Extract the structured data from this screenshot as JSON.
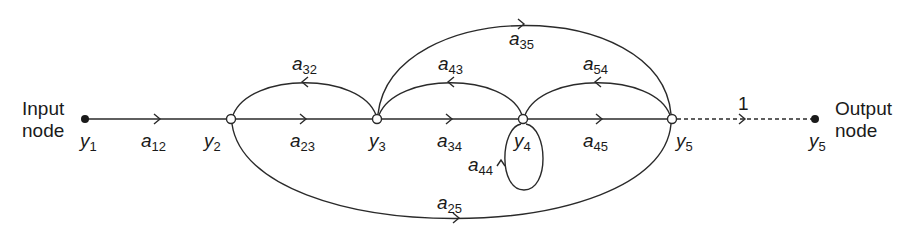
{
  "diagram": {
    "type": "signal-flow-graph",
    "input_label": [
      "Input",
      "node"
    ],
    "output_label": [
      "Output",
      "node"
    ],
    "nodes": [
      {
        "id": "y1",
        "name": "y",
        "sub": "1",
        "x": 85,
        "y": 119,
        "kind": "source"
      },
      {
        "id": "y2",
        "name": "y",
        "sub": "2",
        "x": 231,
        "y": 119,
        "kind": "mixed"
      },
      {
        "id": "y3",
        "name": "y",
        "sub": "3",
        "x": 377,
        "y": 119,
        "kind": "mixed"
      },
      {
        "id": "y4",
        "name": "y",
        "sub": "4",
        "x": 523,
        "y": 119,
        "kind": "mixed"
      },
      {
        "id": "y5",
        "name": "y",
        "sub": "5",
        "x": 672,
        "y": 119,
        "kind": "mixed"
      },
      {
        "id": "y5out",
        "name": "y",
        "sub": "5",
        "x": 815,
        "y": 119,
        "kind": "sink"
      }
    ],
    "branches": [
      {
        "id": "a12",
        "name": "a",
        "sub": "12",
        "from": "y1",
        "to": "y2"
      },
      {
        "id": "a23",
        "name": "a",
        "sub": "23",
        "from": "y2",
        "to": "y3"
      },
      {
        "id": "a34",
        "name": "a",
        "sub": "34",
        "from": "y3",
        "to": "y4"
      },
      {
        "id": "a45",
        "name": "a",
        "sub": "45",
        "from": "y4",
        "to": "y5"
      },
      {
        "id": "a32",
        "name": "a",
        "sub": "32",
        "from": "y3",
        "to": "y2"
      },
      {
        "id": "a43",
        "name": "a",
        "sub": "43",
        "from": "y4",
        "to": "y3"
      },
      {
        "id": "a54",
        "name": "a",
        "sub": "54",
        "from": "y5",
        "to": "y4"
      },
      {
        "id": "a35",
        "name": "a",
        "sub": "35",
        "from": "y3",
        "to": "y5"
      },
      {
        "id": "a25",
        "name": "a",
        "sub": "25",
        "from": "y2",
        "to": "y5"
      },
      {
        "id": "a44",
        "name": "a",
        "sub": "44",
        "from": "y4",
        "to": "y4"
      },
      {
        "id": "unity",
        "name": "1",
        "sub": "",
        "from": "y5",
        "to": "y5out",
        "dashed": true
      }
    ]
  },
  "labels": {
    "input_line1": "Input",
    "input_line2": "node",
    "output_line1": "Output",
    "output_line2": "node",
    "unity_gain": "1",
    "node_var": "y",
    "branch_var": "a",
    "n1": "1",
    "n2": "2",
    "n3": "3",
    "n4": "4",
    "n5": "5",
    "n5out": "5",
    "a12": "12",
    "a23": "23",
    "a34": "34",
    "a45": "45",
    "a32": "32",
    "a43": "43",
    "a54": "54",
    "a35": "35",
    "a25": "25",
    "a44": "44"
  },
  "colors": {
    "stroke": "#2a2a2a",
    "background": "#ffffff"
  }
}
